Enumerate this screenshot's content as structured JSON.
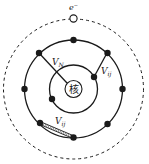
{
  "diagram": {
    "nucleus_label": "核",
    "free_electron_label": "e⁻",
    "labels": {
      "v_n": "V",
      "v_n_sub": "N",
      "v_ij_upper": "V",
      "v_ij_upper_sub": "ij",
      "v_ij_lower": "V",
      "v_ij_lower_sub": "ij"
    },
    "colors": {
      "stroke": "#1a1a1a",
      "background": "#ffffff"
    },
    "shells": [
      {
        "name": "nucleus",
        "radius": 8,
        "style": "solid"
      },
      {
        "name": "inner-shell",
        "radius": 24,
        "style": "solid",
        "electrons": 2
      },
      {
        "name": "outer-shell",
        "radius": 49,
        "style": "solid",
        "electrons": 8
      },
      {
        "name": "outermost-shell",
        "radius": 70,
        "style": "dashed",
        "electrons": 1,
        "electron_state": "open"
      }
    ],
    "interactions": [
      {
        "name": "V_N",
        "type": "electron-nucleus",
        "line": "solid"
      },
      {
        "name": "V_ij",
        "type": "electron-electron (outer to inner)",
        "line": "solid"
      },
      {
        "name": "V_ij",
        "type": "electron-electron (within outer shell)",
        "line": "double"
      }
    ]
  }
}
